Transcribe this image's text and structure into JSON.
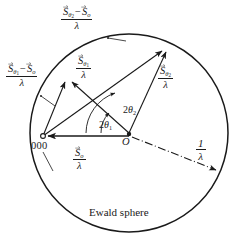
{
  "diagram": {
    "title": "Ewald sphere",
    "caption": "Ewald sphere",
    "colors": {
      "stroke": "#1a1a1a",
      "background": "#ffffff"
    },
    "geometry": {
      "circle_center": [
        129,
        133
      ],
      "circle_radius": 99,
      "origin_000": [
        43,
        136
      ],
      "center_O": [
        129,
        133
      ],
      "point_theta1": [
        68,
        78
      ],
      "point_theta2": [
        165,
        47
      ],
      "radius_arrow_end": [
        218,
        171
      ]
    },
    "labels": {
      "s_theta2_minus_so": {
        "numerator_vec1": "S",
        "numerator_sub1": "θ",
        "numerator_subsub1": "2",
        "minus": "−",
        "numerator_vec2": "S",
        "numerator_sub2": "o",
        "denominator": "λ"
      },
      "s_theta1_minus_so": {
        "numerator_vec1": "S",
        "numerator_sub1": "θ",
        "numerator_subsub1": "1",
        "minus": "−",
        "numerator_vec2": "S",
        "numerator_sub2": "o",
        "denominator": "λ"
      },
      "s_theta1": {
        "numerator_vec": "S",
        "numerator_sub": "θ",
        "numerator_subsub": "1",
        "denominator": "λ"
      },
      "s_theta2": {
        "numerator_vec": "S",
        "numerator_sub": "θ",
        "numerator_subsub": "2",
        "denominator": "λ"
      },
      "s_o": {
        "numerator_vec": "S",
        "numerator_sub": "o",
        "denominator": "λ"
      },
      "one_over_lambda": {
        "numerator": "1",
        "denominator": "λ"
      },
      "angle_2theta2": {
        "value": "2",
        "symbol": "θ",
        "index": "2"
      },
      "angle_2theta1": {
        "value": "2",
        "symbol": "θ",
        "index": "1"
      },
      "origin_000": "000",
      "center_O": "O",
      "ewald_sphere": "Ewald sphere"
    }
  }
}
